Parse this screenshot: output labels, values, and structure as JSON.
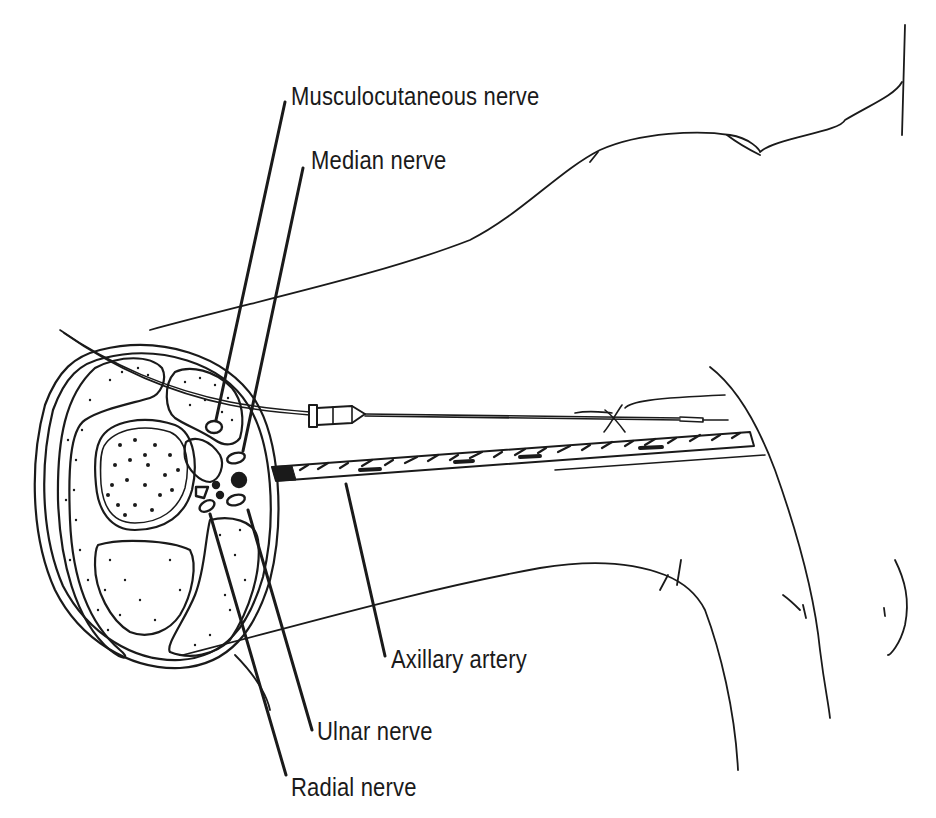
{
  "diagram": {
    "colors": {
      "ink": "#1a1a1a",
      "background": "#ffffff"
    },
    "labels": {
      "musculocutaneous": "Musculocutaneous nerve",
      "median": "Median nerve",
      "axillary_artery": "Axillary artery",
      "ulnar": "Ulnar nerve",
      "radial": "Radial nerve"
    }
  }
}
